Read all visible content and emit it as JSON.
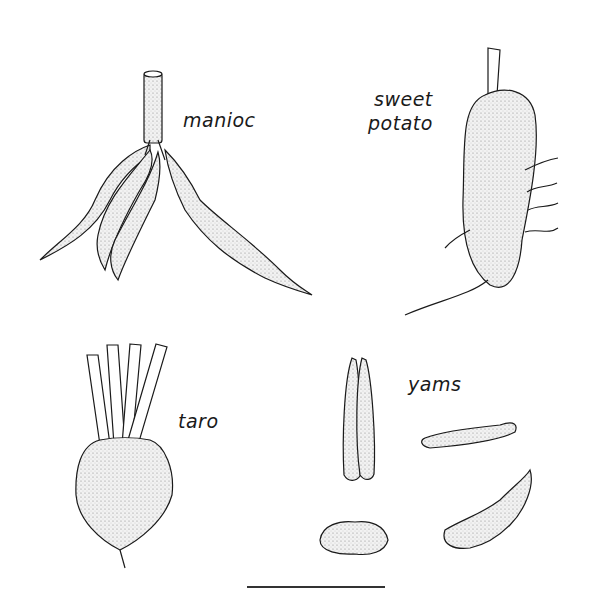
{
  "illustration": {
    "labels": {
      "manioc": "manioc",
      "sweet_potato_line1": "sweet",
      "sweet_potato_line2": "potato",
      "taro": "taro",
      "yams": "yams"
    },
    "colors": {
      "ink": "#1a1a1a",
      "shade": "#cfcfcf",
      "background": "#ffffff"
    }
  }
}
